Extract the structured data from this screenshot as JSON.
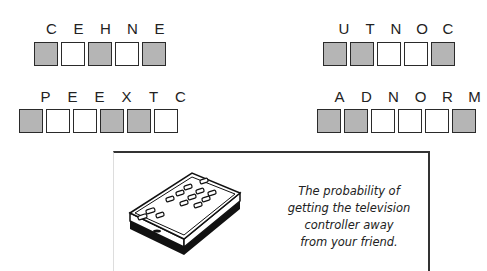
{
  "puzzles": [
    {
      "id": "p1",
      "letters": [
        "C",
        "E",
        "H",
        "N",
        "E"
      ],
      "shaded": [
        true,
        false,
        true,
        false,
        true
      ]
    },
    {
      "id": "p2",
      "letters": [
        "U",
        "T",
        "N",
        "O",
        "C"
      ],
      "shaded": [
        true,
        true,
        false,
        false,
        true
      ]
    },
    {
      "id": "p3",
      "letters": [
        "P",
        "E",
        "E",
        "X",
        "T",
        "C"
      ],
      "shaded": [
        true,
        false,
        false,
        true,
        true,
        false
      ]
    },
    {
      "id": "p4",
      "letters": [
        "A",
        "D",
        "N",
        "O",
        "R",
        "M"
      ],
      "shaded": [
        true,
        true,
        false,
        false,
        false,
        true
      ]
    }
  ],
  "panel": {
    "illustration": "tv-remote-control",
    "caption_lines": [
      "The probability of",
      "getting the television",
      "controller away",
      "from your friend."
    ]
  },
  "colors": {
    "shaded_box": "#b5b5b5",
    "border": "#2a2a2a"
  }
}
